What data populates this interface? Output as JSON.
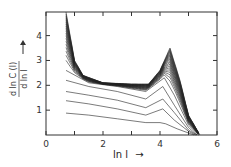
{
  "chart_data": {
    "type": "line",
    "title": "",
    "xlabel": "ln l",
    "ylabel": "d ln C(l) / d ln l",
    "xlim": [
      0,
      6
    ],
    "ylim": [
      0,
      4.95
    ],
    "xticks": [
      0,
      1,
      2,
      3,
      4,
      5,
      6
    ],
    "xtick_labels": [
      "0",
      "",
      "2",
      "",
      "4",
      "",
      "6"
    ],
    "yticks": [
      1,
      2,
      3,
      4
    ],
    "ytick_labels": [
      "1",
      "2",
      "3",
      "4"
    ],
    "grid": false,
    "legend": null,
    "series_count": 24,
    "series": [
      {
        "name": "curve 1",
        "x": [
          0.7,
          1.5,
          2.5,
          3.5,
          4.0,
          4.2,
          4.6,
          5.0,
          5.2
        ],
        "y": [
          0.88,
          0.8,
          0.65,
          0.5,
          0.5,
          0.45,
          0.25,
          0.08,
          0.0
        ]
      },
      {
        "name": "curve 2",
        "x": [
          0.7,
          1.5,
          2.5,
          3.5,
          4.1,
          4.5,
          5.0,
          5.25
        ],
        "y": [
          1.38,
          1.25,
          1.05,
          0.8,
          1.05,
          0.6,
          0.15,
          0.0
        ]
      },
      {
        "name": "curve 3",
        "x": [
          0.7,
          1.5,
          2.5,
          3.5,
          4.1,
          4.5,
          5.0,
          5.3
        ],
        "y": [
          1.75,
          1.6,
          1.4,
          1.1,
          1.45,
          0.9,
          0.2,
          0.0
        ]
      },
      {
        "name": "curve 4",
        "x": [
          0.7,
          1.5,
          2.5,
          3.5,
          4.1,
          4.5,
          5.0,
          5.3
        ],
        "y": [
          2.2,
          1.95,
          1.75,
          1.45,
          1.95,
          1.2,
          0.3,
          0.0
        ]
      },
      {
        "name": "curve 5",
        "x": [
          0.7,
          1.5,
          2.5,
          3.5,
          4.15,
          4.5,
          5.0,
          5.35
        ],
        "y": [
          2.6,
          2.1,
          1.95,
          1.75,
          2.3,
          1.6,
          0.4,
          0.0
        ]
      },
      {
        "name": "curve top",
        "x": [
          0.7,
          1.0,
          1.3,
          2.0,
          3.0,
          3.6,
          4.0,
          4.35,
          4.7,
          5.0,
          5.4
        ],
        "y": [
          4.95,
          3.0,
          2.4,
          2.1,
          2.05,
          2.05,
          2.6,
          3.5,
          2.2,
          0.8,
          0.0
        ]
      }
    ]
  },
  "axes": {
    "x_label": "ln l",
    "y_label_num": "d ln C (l)",
    "y_label_den": "d ln l",
    "x_tick_labels": [
      "0",
      "2",
      "4",
      "6"
    ],
    "y_tick_labels": [
      "1",
      "2",
      "3",
      "4"
    ]
  }
}
